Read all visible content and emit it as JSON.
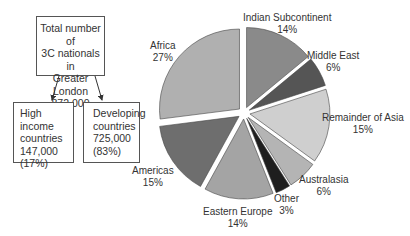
{
  "flow": {
    "total": {
      "line1": "Total number of",
      "line2": "3C nationals in",
      "line3": "Greater London",
      "value": "872,000"
    },
    "high_income": {
      "line1": "High income",
      "line2": "countries",
      "value": "147,000",
      "pct": "(17%)"
    },
    "developing": {
      "line1": "Developing",
      "line2": "countries",
      "value": "725,000",
      "pct": "(83%)"
    }
  },
  "labels": {
    "indian": {
      "name": "Indian Subcontinent",
      "pct": "14%"
    },
    "middle_east": {
      "name": "Middle East",
      "pct": "6%"
    },
    "rest_asia": {
      "name": "Remainder of Asia",
      "pct": "15%"
    },
    "australasia": {
      "name": "Australasia",
      "pct": "6%"
    },
    "other": {
      "name": "Other",
      "pct": "3%"
    },
    "east_europe": {
      "name": "Eastern Europe",
      "pct": "14%"
    },
    "americas": {
      "name": "Americas",
      "pct": "15%"
    },
    "africa": {
      "name": "Africa",
      "pct": "27%"
    }
  },
  "chart_data": {
    "type": "pie",
    "title": "",
    "categories": [
      "Indian Subcontinent",
      "Middle East",
      "Remainder of Asia",
      "Australasia",
      "Other",
      "Eastern Europe",
      "Americas",
      "Africa"
    ],
    "values": [
      14,
      6,
      15,
      6,
      3,
      14,
      15,
      27
    ],
    "colors": [
      "#8a8a8a",
      "#555555",
      "#cfcfcf",
      "#b4b4b4",
      "#1e1e1e",
      "#a4a4a4",
      "#6e6e6e",
      "#b0b0b0"
    ],
    "exploded": true,
    "annotation": "Breakdown of 725,000 nationals from developing countries"
  }
}
